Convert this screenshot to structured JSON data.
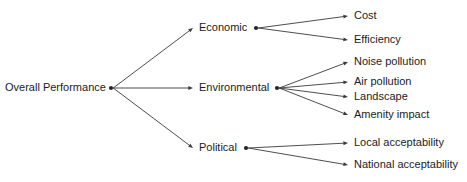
{
  "diagram": {
    "type": "tree",
    "background_color": "#ffffff",
    "line_color": "#3a3a3a",
    "text_color": "#1c1c1c",
    "root": {
      "label": "Overall Performance",
      "x": 5,
      "y": 88,
      "dot_x": 111,
      "dot_y": 88
    },
    "branches": [
      {
        "label": "Economic",
        "text_x": 199,
        "text_y": 28,
        "arrow_x": 193,
        "dot_x": 256,
        "dot_y": 28,
        "children": [
          {
            "label": "Cost",
            "text_x": 354,
            "text_y": 16,
            "arrow_x": 348
          },
          {
            "label": "Efficiency",
            "text_x": 354,
            "text_y": 40,
            "arrow_x": 348
          }
        ]
      },
      {
        "label": "Environmental",
        "text_x": 199,
        "text_y": 88,
        "arrow_x": 193,
        "dot_x": 277,
        "dot_y": 88,
        "children": [
          {
            "label": "Noise pollution",
            "text_x": 354,
            "text_y": 62,
            "arrow_x": 348
          },
          {
            "label": "Air pollution",
            "text_x": 354,
            "text_y": 82,
            "arrow_x": 348
          },
          {
            "label": "Landscape",
            "text_x": 354,
            "text_y": 97,
            "arrow_x": 348
          },
          {
            "label": "Amenity impact",
            "text_x": 354,
            "text_y": 115,
            "arrow_x": 348
          }
        ]
      },
      {
        "label": "Political",
        "text_x": 199,
        "text_y": 148,
        "arrow_x": 193,
        "dot_x": 246,
        "dot_y": 148,
        "children": [
          {
            "label": "Local acceptability",
            "text_x": 354,
            "text_y": 143,
            "arrow_x": 348
          },
          {
            "label": "National acceptability",
            "text_x": 354,
            "text_y": 165,
            "arrow_x": 348
          }
        ]
      }
    ]
  }
}
